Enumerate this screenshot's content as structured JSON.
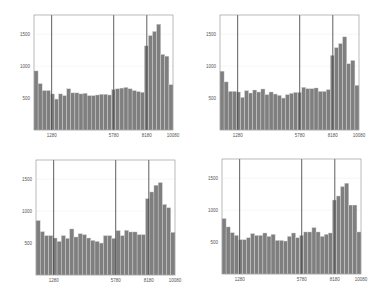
{
  "style": {
    "bar_color": "#7f7f7f",
    "bar_edge": "#d9d9d9",
    "frame_color": "#8c8c8c",
    "marker_line_color": "#4d4d4d",
    "grid_color": "#ececec"
  },
  "chart_data": [
    {
      "type": "bar",
      "position": "top-left",
      "title": "",
      "xlabel": "",
      "ylabel": "",
      "xlim": [
        0,
        10080
      ],
      "ylim": [
        0,
        1800
      ],
      "xticks": [
        1280,
        5780,
        8180,
        10080
      ],
      "xtick_labels": [
        "1280",
        "5780",
        "8180",
        "10080"
      ],
      "yticks": [
        500,
        1000,
        1500
      ],
      "ytick_labels": [
        "500",
        "1000",
        "1500"
      ],
      "vertical_lines": [
        1280,
        5780,
        8180
      ],
      "grid": true,
      "values": [
        925,
        726,
        618,
        618,
        565,
        484,
        565,
        538,
        645,
        581,
        581,
        565,
        575,
        538,
        538,
        548,
        559,
        559,
        548,
        634,
        645,
        656,
        667,
        645,
        618,
        602,
        591,
        1317,
        1478,
        1543,
        1656,
        1183,
        1156,
        710
      ]
    },
    {
      "type": "bar",
      "position": "top-right",
      "title": "",
      "xlabel": "",
      "ylabel": "",
      "xlim": [
        0,
        10080
      ],
      "ylim": [
        0,
        1800
      ],
      "xticks": [
        1280,
        5780,
        8180,
        10080
      ],
      "xtick_labels": [
        "1280",
        "5780",
        "8180",
        "10080"
      ],
      "yticks": [
        500,
        1000,
        1500
      ],
      "ytick_labels": [
        "500",
        "1000",
        "1500"
      ],
      "vertical_lines": [
        1280,
        5780,
        8180
      ],
      "grid": true,
      "values": [
        921,
        753,
        605,
        605,
        595,
        511,
        616,
        579,
        626,
        595,
        642,
        553,
        595,
        563,
        542,
        500,
        553,
        574,
        589,
        589,
        668,
        647,
        647,
        658,
        605,
        605,
        632,
        1168,
        1289,
        1353,
        1458,
        1037,
        1089,
        700
      ]
    },
    {
      "type": "bar",
      "position": "bottom-left",
      "title": "",
      "xlabel": "",
      "ylabel": "",
      "xlim": [
        0,
        10080
      ],
      "ylim": [
        0,
        1800
      ],
      "xticks": [
        1280,
        5780,
        8180,
        10080
      ],
      "xtick_labels": [
        "1280",
        "5780",
        "8180",
        "10080"
      ],
      "yticks": [
        500,
        1000,
        1500
      ],
      "ytick_labels": [
        "500",
        "1000",
        "1500"
      ],
      "vertical_lines": [
        1280,
        5780,
        8180
      ],
      "grid": true,
      "values": [
        853,
        679,
        616,
        616,
        579,
        526,
        616,
        574,
        721,
        595,
        647,
        632,
        579,
        542,
        526,
        500,
        616,
        616,
        574,
        695,
        616,
        700,
        674,
        674,
        632,
        632,
        1195,
        1300,
        1405,
        1447,
        1105,
        1053,
        668
      ]
    },
    {
      "type": "bar",
      "position": "bottom-right",
      "title": "",
      "xlabel": "",
      "ylabel": "",
      "xlim": [
        0,
        10080
      ],
      "ylim": [
        0,
        1800
      ],
      "xticks": [
        1280,
        5780,
        8180,
        10080
      ],
      "xtick_labels": [
        "1280",
        "5780",
        "8180",
        "10080"
      ],
      "yticks": [
        500,
        1000,
        1500
      ],
      "ytick_labels": [
        "500",
        "1000",
        "1500"
      ],
      "vertical_lines": [
        1280,
        5780,
        8180
      ],
      "grid": true,
      "values": [
        868,
        737,
        647,
        605,
        537,
        537,
        568,
        632,
        605,
        605,
        642,
        589,
        621,
        526,
        526,
        516,
        589,
        642,
        568,
        605,
        658,
        658,
        726,
        658,
        589,
        621,
        642,
        1158,
        1221,
        1368,
        1421,
        1079,
        1079,
        658
      ]
    }
  ]
}
